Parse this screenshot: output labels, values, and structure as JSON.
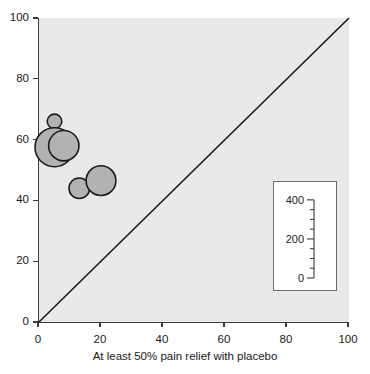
{
  "figure": {
    "top_caption_remnant": "",
    "background_color": "#ffffff",
    "plot_background_color": "#e9e9e9",
    "axis_color": "#3a3a3a",
    "bubble_fill_color": "#b2b2b2",
    "bubble_edge_color": "#1a1a1a"
  },
  "chart_data": {
    "type": "scatter",
    "title": "",
    "xlabel": "At least 50% pain relief with placebo",
    "ylabel": "",
    "xlim": [
      0,
      100
    ],
    "ylim": [
      0,
      100
    ],
    "grid": false,
    "xticks": [
      0,
      20,
      40,
      60,
      80,
      100
    ],
    "yticks": [
      0,
      20,
      40,
      60,
      80,
      100
    ],
    "xtick_labels": [
      "0",
      "20",
      "40",
      "60",
      "80",
      "100"
    ],
    "ytick_labels": [
      "0",
      "20",
      "40",
      "60",
      "80",
      "100"
    ],
    "reference_line": {
      "name": "line-of-equality",
      "from": [
        0,
        0
      ],
      "to": [
        100,
        100
      ],
      "color": "#1a1a1a"
    },
    "size_encoding": "Number of patients",
    "points": [
      {
        "x": 5,
        "y": 66,
        "size": 60
      },
      {
        "x": 5,
        "y": 57.5,
        "size": 430
      },
      {
        "x": 8,
        "y": 58,
        "size": 260
      },
      {
        "x": 13,
        "y": 44,
        "size": 120
      },
      {
        "x": 20,
        "y": 46.5,
        "size": 250
      }
    ],
    "legend": {
      "position": "inset-bottom-right",
      "axis_ticks_major": [
        0,
        200,
        400
      ],
      "axis_tick_labels": [
        "0",
        "200",
        "400"
      ],
      "axis_ticks_minor": [
        50,
        100,
        150,
        250,
        300,
        350
      ],
      "axis_range": [
        0,
        430
      ]
    }
  }
}
